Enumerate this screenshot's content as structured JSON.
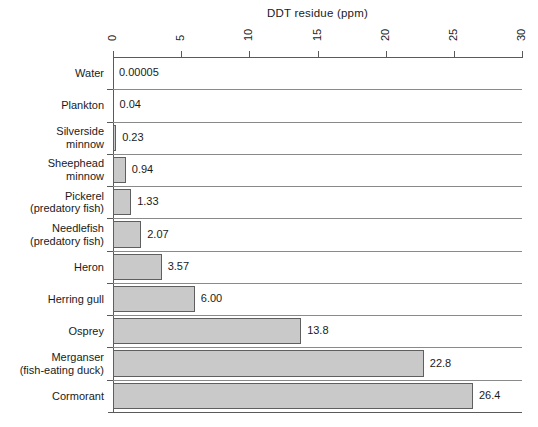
{
  "chart_data": {
    "type": "bar",
    "orientation": "horizontal",
    "title": "DDT residue  (ppm)",
    "xlabel": "DDT residue (ppm)",
    "ylabel": "",
    "xlim": [
      0,
      30
    ],
    "xticks": [
      0,
      5,
      10,
      15,
      20,
      25,
      30
    ],
    "xtick_labels": [
      "0",
      "5",
      "10",
      "15",
      "20",
      "25",
      "30"
    ],
    "grid": false,
    "legend": null,
    "tick_label_rotation": 90,
    "bar_color": "#c9c9c9",
    "bar_edge_color": "#5f5f5f",
    "axis_color": "#5a5a5a",
    "categories": [
      "Water",
      "Plankton",
      "Silverside minnow",
      "Sheephead minnow",
      "Pickerel (predatory fish)",
      "Needlefish (predatory fish)",
      "Heron",
      "Herring gull",
      "Osprey",
      "Merganser (fish-eating duck)",
      "Cormorant"
    ],
    "values": [
      5e-05,
      0.04,
      0.23,
      0.94,
      1.33,
      2.07,
      3.57,
      6.0,
      13.8,
      22.8,
      26.4
    ],
    "value_labels": [
      "0.00005",
      "0.04",
      "0.23",
      "0.94",
      "1.33",
      "2.07",
      "3.57",
      "6.00",
      "13.8",
      "22.8",
      "26.4"
    ],
    "rows": [
      {
        "lines": [
          "Water"
        ],
        "value": 5e-05,
        "label": "0.00005"
      },
      {
        "lines": [
          "Plankton"
        ],
        "value": 0.04,
        "label": "0.04"
      },
      {
        "lines": [
          "Silverside",
          "minnow"
        ],
        "value": 0.23,
        "label": "0.23"
      },
      {
        "lines": [
          "Sheephead",
          "minnow"
        ],
        "value": 0.94,
        "label": "0.94"
      },
      {
        "lines": [
          "Pickerel",
          "(predatory fish)"
        ],
        "value": 1.33,
        "label": "1.33"
      },
      {
        "lines": [
          "Needlefish",
          "(predatory fish)"
        ],
        "value": 2.07,
        "label": "2.07"
      },
      {
        "lines": [
          "Heron"
        ],
        "value": 3.57,
        "label": "3.57"
      },
      {
        "lines": [
          "Herring gull"
        ],
        "value": 6.0,
        "label": "6.00"
      },
      {
        "lines": [
          "Osprey"
        ],
        "value": 13.8,
        "label": "13.8"
      },
      {
        "lines": [
          "Merganser",
          "(fish-eating duck)"
        ],
        "value": 22.8,
        "label": "22.8"
      },
      {
        "lines": [
          "Cormorant"
        ],
        "value": 26.4,
        "label": "26.4"
      }
    ]
  }
}
